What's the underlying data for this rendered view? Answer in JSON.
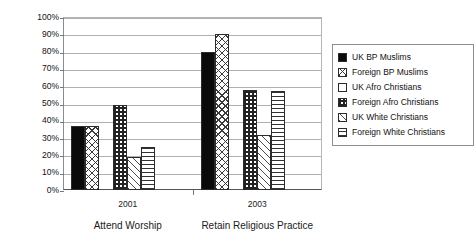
{
  "chart_data": {
    "type": "bar",
    "title": "",
    "xlabel": "",
    "ylabel": "",
    "ylim": [
      0,
      100
    ],
    "yticks": [
      "0%",
      "10%",
      "20%",
      "30%",
      "40%",
      "50%",
      "60%",
      "70%",
      "80%",
      "90%",
      "100%"
    ],
    "grid": true,
    "legend_position": "right",
    "categories": [
      "2001",
      "2003"
    ],
    "category_captions": [
      "Attend Worship",
      "Retain Religious Practice"
    ],
    "series": [
      {
        "name": "UK BP Muslims",
        "pattern": "solid-black",
        "values": [
          37,
          80
        ]
      },
      {
        "name": "Foreign BP Muslims",
        "pattern": "cross-hatch",
        "values": [
          37,
          90
        ]
      },
      {
        "name": "UK Afro Christians",
        "pattern": "empty-white",
        "values": [
          0,
          0
        ]
      },
      {
        "name": "Foreign Afro Christians",
        "pattern": "dense-grid",
        "values": [
          49,
          58
        ]
      },
      {
        "name": "UK White Christians",
        "pattern": "diagonal-stripes",
        "values": [
          19,
          32
        ]
      },
      {
        "name": "Foreign White Christians",
        "pattern": "horizontal-stripes",
        "values": [
          25,
          57
        ]
      }
    ]
  }
}
